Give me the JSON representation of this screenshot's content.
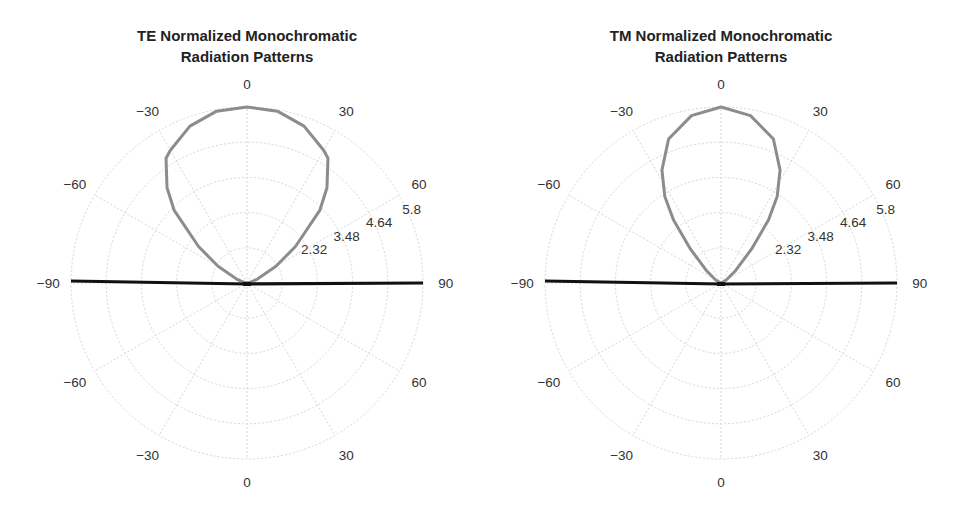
{
  "chart_data": [
    {
      "type": "polar",
      "title": "TE Normalized Monochromatic Radiation Patterns",
      "title_lines": [
        "TE Normalized Monochromatic",
        "Radiation Patterns"
      ],
      "angular_ticks": [
        "0",
        "30",
        "60",
        "90",
        "60",
        "30",
        "0",
        "-30",
        "-60",
        "-90",
        "-60",
        "-30"
      ],
      "radial_ticks": [
        "2.32",
        "3.48",
        "4.64",
        "5.8"
      ],
      "radial_grid": [
        1.16,
        2.32,
        3.48,
        4.64,
        5.8
      ],
      "rmax": 5.8,
      "grid": true,
      "series": [
        {
          "name": "TE lobe",
          "color": "#8c8c8c",
          "theta_deg": [
            -90,
            -80,
            -70,
            -60,
            -53,
            -45,
            -40,
            -33,
            -30,
            -20,
            -10,
            0,
            10,
            20,
            30,
            33,
            40,
            45,
            53,
            60,
            70,
            80,
            90
          ],
          "r": [
            0,
            0.08,
            0.35,
            1.1,
            2.0,
            3.4,
            4.1,
            4.9,
            5.05,
            5.5,
            5.75,
            5.8,
            5.75,
            5.5,
            5.05,
            4.9,
            4.1,
            3.4,
            2.0,
            1.1,
            0.35,
            0.08,
            0
          ]
        },
        {
          "name": "horizon line",
          "color": "#111111",
          "theta_deg": [
            -90,
            90
          ],
          "r": [
            5.8,
            5.8
          ]
        }
      ]
    },
    {
      "type": "polar",
      "title": "TM Normalized Monochromatic Radiation Patterns",
      "title_lines": [
        "TM Normalized Monochromatic",
        "Radiation Patterns"
      ],
      "angular_ticks": [
        "0",
        "30",
        "60",
        "90",
        "60",
        "30",
        "0",
        "-30",
        "-60",
        "-90",
        "-60",
        "-30"
      ],
      "radial_ticks": [
        "2.32",
        "3.48",
        "4.64",
        "5.8"
      ],
      "radial_grid": [
        1.16,
        2.32,
        3.48,
        4.64,
        5.8
      ],
      "rmax": 5.8,
      "grid": true,
      "series": [
        {
          "name": "TM lobe",
          "color": "#8c8c8c",
          "theta_deg": [
            -90,
            -60,
            -50,
            -42,
            -37,
            -33,
            -27.6,
            -20,
            -10,
            0,
            10,
            20,
            27.6,
            33,
            37,
            42,
            50,
            60,
            90
          ],
          "r": [
            0,
            0.2,
            0.6,
            1.5,
            2.6,
            3.4,
            4.2,
            5.05,
            5.6,
            5.8,
            5.6,
            5.05,
            4.2,
            3.4,
            2.6,
            1.5,
            0.6,
            0.2,
            0
          ]
        },
        {
          "name": "horizon line",
          "color": "#111111",
          "theta_deg": [
            -90,
            90
          ],
          "r": [
            5.8,
            5.8
          ]
        }
      ]
    }
  ],
  "panels": [
    {
      "title_line1": "TE Normalized Monochromatic",
      "title_line2": "Radiation Patterns"
    },
    {
      "title_line1": "TM Normalized Monochromatic",
      "title_line2": "Radiation Patterns"
    }
  ]
}
